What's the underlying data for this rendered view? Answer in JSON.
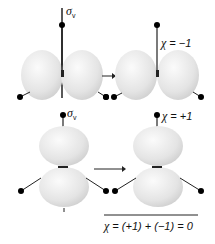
{
  "diagram": {
    "title": "",
    "top_row": {
      "symmetry_operation": {
        "symbol": "σ",
        "subscript": "v"
      },
      "result_label": {
        "symbol": "χ",
        "text": " = −1"
      }
    },
    "bottom_row": {
      "symmetry_operation": {
        "symbol": "σ",
        "subscript": "v"
      },
      "result_label": {
        "symbol": "χ",
        "text": " = +1"
      }
    },
    "sum": {
      "symbol": "χ",
      "text": " = (+1) + (−1) = 0"
    },
    "colors": {
      "lobe": "#e6e6e6",
      "lobe_highlight": "#f7f7f7",
      "bond": "#222222",
      "atom": "#000000"
    }
  }
}
